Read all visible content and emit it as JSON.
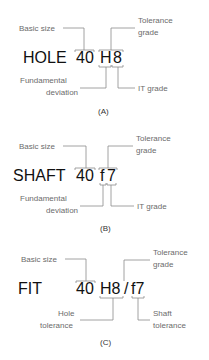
{
  "panels": [
    {
      "id": "A",
      "word": "HOLE",
      "size": "40",
      "code": "H8",
      "letter": "H",
      "digit": "8",
      "labels": {
        "basic_size": "Basic size",
        "tolerance_grade_1": "Tolerance",
        "tolerance_grade_2": "grade",
        "fundamental_1": "Fundamental",
        "fundamental_2": "deviation",
        "it_grade": "IT grade"
      },
      "caption": "(A)"
    },
    {
      "id": "B",
      "word": "SHAFT",
      "size": "40",
      "code": "f7",
      "letter": "f",
      "digit": "7",
      "labels": {
        "basic_size": "Basic size",
        "tolerance_grade_1": "Tolerance",
        "tolerance_grade_2": "grade",
        "fundamental_1": "Fundamental",
        "fundamental_2": "deviation",
        "it_grade": "IT grade"
      },
      "caption": "(B)"
    },
    {
      "id": "C",
      "word": "FIT",
      "size": "40",
      "hole_code": "H8",
      "slash": "/",
      "shaft_code": "f7",
      "labels": {
        "basic_size": "Basic size",
        "tolerance_grade_1": "Tolerance",
        "tolerance_grade_2": "grade",
        "hole_tol_1": "Hole",
        "hole_tol_2": "tolerance",
        "shaft_tol_1": "Shaft",
        "shaft_tol_2": "tolerance"
      },
      "caption": "(C)"
    }
  ]
}
